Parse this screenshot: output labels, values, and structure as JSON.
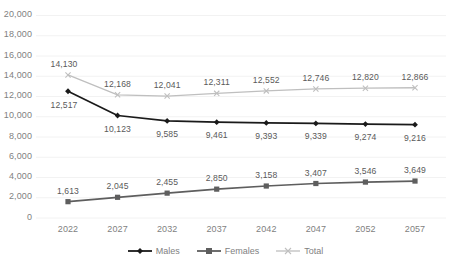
{
  "chart_data": {
    "type": "line",
    "title": "",
    "xlabel": "",
    "ylabel": "",
    "categories": [
      "2022",
      "2027",
      "2032",
      "2037",
      "2042",
      "2047",
      "2052",
      "2057"
    ],
    "ylim": [
      0,
      20000
    ],
    "ytick_values": [
      0,
      2000,
      4000,
      6000,
      8000,
      10000,
      12000,
      14000,
      16000,
      18000,
      20000
    ],
    "ytick_labels": [
      "0",
      "2,000",
      "4,000",
      "6,000",
      "8,000",
      "10,000",
      "12,000",
      "14,000",
      "16,000",
      "18,000",
      "20,000"
    ],
    "grid": true,
    "legend_position": "bottom",
    "series": [
      {
        "name": "Males",
        "color": "#1a1a1a",
        "marker": "diamond",
        "label_position": "below",
        "values": [
          12517,
          10123,
          9585,
          9461,
          9393,
          9339,
          9274,
          9216
        ],
        "labels": [
          "12,517",
          "10,123",
          "9,585",
          "9,461",
          "9,393",
          "9,339",
          "9,274",
          "9,216"
        ]
      },
      {
        "name": "Females",
        "color": "#5e5e5e",
        "marker": "square",
        "label_position": "above",
        "values": [
          1613,
          2045,
          2455,
          2850,
          3158,
          3407,
          3546,
          3649
        ],
        "labels": [
          "1,613",
          "2,045",
          "2,455",
          "2,850",
          "3,158",
          "3,407",
          "3,546",
          "3,649"
        ]
      },
      {
        "name": "Total",
        "color": "#bfbfbf",
        "marker": "cross",
        "label_position": "above",
        "values": [
          14130,
          12168,
          12041,
          12311,
          12552,
          12746,
          12820,
          12866
        ],
        "labels": [
          "14,130",
          "12,168",
          "12,041",
          "12,311",
          "12,552",
          "12,746",
          "12,820",
          "12,866"
        ]
      }
    ]
  },
  "legend": {
    "items": [
      {
        "label": "Males"
      },
      {
        "label": "Females"
      },
      {
        "label": "Total"
      }
    ]
  },
  "colors": {
    "males": "#1a1a1a",
    "females": "#5e5e5e",
    "total": "#bfbfbf",
    "grid": "#f2f2f2",
    "tick_text": "#7f7f7f",
    "label_text": "#5a5a5a",
    "background": "#ffffff"
  }
}
